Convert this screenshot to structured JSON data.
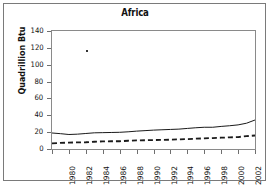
{
  "chart_data": {
    "type": "line",
    "title": "Africa",
    "xlabel": "",
    "ylabel": "Quadrillion Btu",
    "xlim": [
      1980,
      2004
    ],
    "ylim": [
      0,
      140
    ],
    "ytick_values": [
      0,
      20,
      40,
      60,
      80,
      100,
      120,
      140
    ],
    "ytick_labels": [
      "0",
      "20",
      "40",
      "60",
      "80",
      "100",
      "120",
      "140"
    ],
    "xtick_values": [
      1980,
      1982,
      1984,
      1986,
      1988,
      1990,
      1992,
      1994,
      1996,
      1998,
      2000,
      2002,
      2004
    ],
    "xtick_labels": [
      "1980",
      "1982",
      "1984",
      "1986",
      "1988",
      "1990",
      "1992",
      "1994",
      "1996",
      "1998",
      "2000",
      "2002",
      "2004"
    ],
    "grid": false,
    "legend": "none",
    "x": [
      1980,
      1981,
      1982,
      1983,
      1984,
      1985,
      1986,
      1987,
      1988,
      1989,
      1990,
      1991,
      1992,
      1993,
      1994,
      1995,
      1996,
      1997,
      1998,
      1999,
      2000,
      2001,
      2002,
      2003,
      2004
    ],
    "series": [
      {
        "name": "Production",
        "style": "solid",
        "color": "#1a1a1a",
        "values": [
          19.0,
          18.2,
          17.2,
          17.6,
          18.4,
          19.2,
          19.4,
          19.6,
          19.8,
          20.4,
          21.2,
          21.8,
          22.4,
          22.8,
          23.2,
          23.6,
          24.4,
          25.2,
          25.8,
          25.8,
          26.8,
          27.6,
          28.6,
          30.6,
          34.4
        ]
      },
      {
        "name": "Consumption",
        "style": "dashed",
        "color": "#1a1a1a",
        "values": [
          6.6,
          7.2,
          7.6,
          7.8,
          8.0,
          8.6,
          9.0,
          9.2,
          9.2,
          9.8,
          10.2,
          10.4,
          10.6,
          10.8,
          11.0,
          11.4,
          11.8,
          12.2,
          12.6,
          13.0,
          13.4,
          13.8,
          14.2,
          15.2,
          16.0
        ]
      }
    ],
    "artifacts": [
      {
        "name": "speck",
        "x": 1984,
        "y": 117
      }
    ]
  },
  "figure": {
    "title": "Africa",
    "y_axis_title": "Quadrillion Btu"
  }
}
